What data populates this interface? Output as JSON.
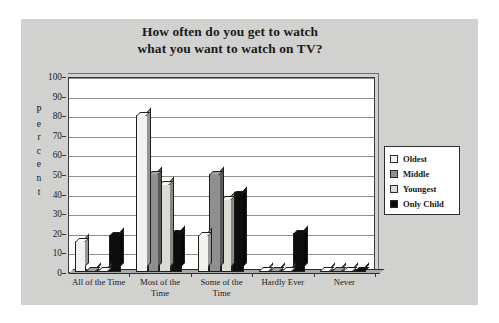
{
  "chart_data": {
    "type": "bar",
    "title": "How often do you get to watch what you want to watch on TV?",
    "title_line1": "How often do you get to watch",
    "title_line2": "what you want to watch on TV?",
    "xlabel": "",
    "ylabel": "Percent",
    "ylim": [
      0,
      100
    ],
    "ytick_values": [
      0,
      10,
      20,
      30,
      40,
      50,
      60,
      70,
      80,
      90,
      100
    ],
    "ytick_labels": [
      "0",
      "10",
      "20",
      "30",
      "40",
      "50",
      "60",
      "70",
      "80",
      "90",
      "100"
    ],
    "grid": true,
    "legend_position": "right",
    "categories": [
      "All of the Time",
      "Most of the Time",
      "Some of the Time",
      "Hardly Ever",
      "Never"
    ],
    "category_lines": [
      [
        "All of the Time"
      ],
      [
        "Most of the",
        "Time"
      ],
      [
        "Some of the",
        "Time"
      ],
      [
        "Hardly Ever"
      ],
      [
        "Never"
      ]
    ],
    "series": [
      {
        "name": "Oldest",
        "color": "#f2f1ed",
        "values": [
          16,
          80,
          19,
          0,
          0
        ]
      },
      {
        "name": "Middle",
        "color": "#8f8f8f",
        "values": [
          0,
          50,
          50,
          0,
          0
        ]
      },
      {
        "name": "Youngest",
        "color": "#dcdad4",
        "values": [
          0,
          45,
          37,
          0,
          0
        ]
      },
      {
        "name": "Only Child",
        "color": "#0d0d0d",
        "values": [
          19,
          20,
          40,
          20,
          0
        ]
      }
    ]
  },
  "legend": {
    "items": [
      {
        "label": "Oldest",
        "color": "#f2f1ed"
      },
      {
        "label": "Middle",
        "color": "#8f8f8f"
      },
      {
        "label": "Youngest",
        "color": "#dcdad4"
      },
      {
        "label": "Only Child",
        "color": "#0d0d0d"
      }
    ]
  },
  "axis": {
    "y_label_letters": [
      "P",
      "e",
      "r",
      "c",
      "e",
      "n",
      "t"
    ]
  }
}
